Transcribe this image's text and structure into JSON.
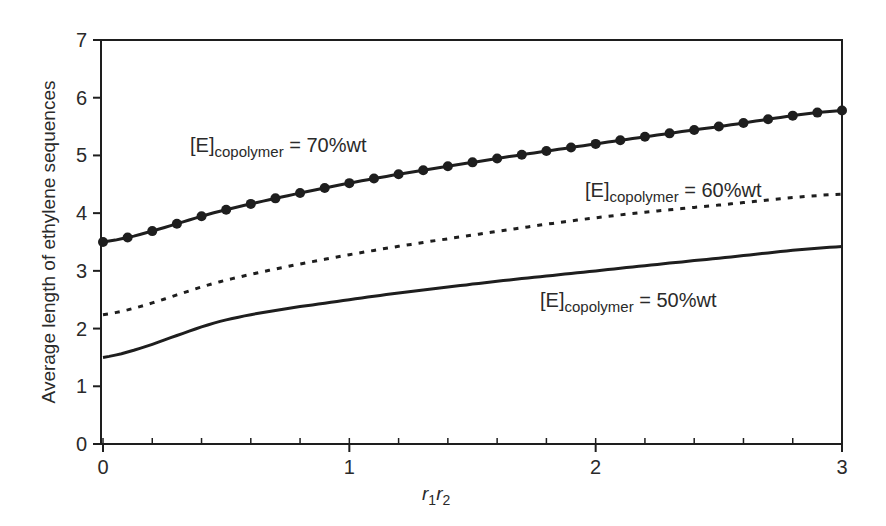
{
  "chart_data": {
    "type": "line",
    "title": "",
    "xlabel": "r1r2",
    "xlabel_parts": {
      "r": "r",
      "sub1": "1",
      "sub2": "2"
    },
    "ylabel": "Average length of ethylene sequences",
    "xlim": [
      0,
      3
    ],
    "ylim": [
      0,
      7
    ],
    "x_ticks": [
      0,
      1,
      2,
      3
    ],
    "x_minor_step": 0.2,
    "y_ticks": [
      0,
      1,
      2,
      3,
      4,
      5,
      6,
      7
    ],
    "grid": false,
    "legend": "inline labels",
    "x": [
      0,
      0.5,
      1,
      1.5,
      2,
      2.5,
      3
    ],
    "series": [
      {
        "name": "[E]copolymer = 70%wt",
        "label_prefix": "[E]",
        "label_sub": "copolymer",
        "label_suffix": " = 70%wt",
        "style": "solid-with-markers",
        "marker_step": 0.1,
        "values": [
          3.5,
          4.06,
          4.52,
          4.88,
          5.2,
          5.5,
          5.78
        ]
      },
      {
        "name": "[E]copolymer = 60%wt",
        "label_prefix": "[E]",
        "label_sub": "copolymer",
        "label_suffix": " = 60%wt",
        "style": "dotted",
        "values": [
          2.24,
          2.84,
          3.28,
          3.62,
          3.92,
          4.14,
          4.33
        ]
      },
      {
        "name": "[E]copolymer = 50%wt",
        "label_prefix": "[E]",
        "label_sub": "copolymer",
        "label_suffix": " = 50%wt",
        "style": "solid",
        "values": [
          1.5,
          2.15,
          2.5,
          2.77,
          3.0,
          3.22,
          3.42
        ]
      }
    ],
    "annotations": [
      {
        "text": "[E]copolymer = 70%wt",
        "x_px": 190,
        "y_px": 152
      },
      {
        "text": "[E]copolymer = 60%wt",
        "x_px": 585,
        "y_px": 197
      },
      {
        "text": "[E]copolymer = 50%wt",
        "x_px": 540,
        "y_px": 307
      }
    ]
  },
  "colors": {
    "line": "#1e1e1e",
    "text": "#2a2a2a",
    "background": "#ffffff"
  }
}
